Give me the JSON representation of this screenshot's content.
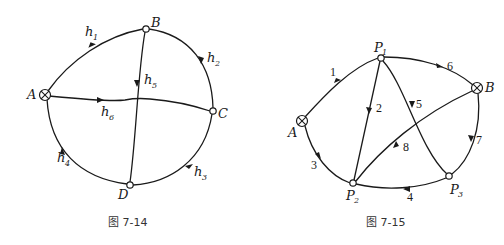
{
  "figures": [
    {
      "caption": "图 7-14",
      "nodes": [
        {
          "id": "A",
          "label": "A",
          "type": "source"
        },
        {
          "id": "B",
          "label": "B",
          "type": "junction"
        },
        {
          "id": "C",
          "label": "C",
          "type": "junction"
        },
        {
          "id": "D",
          "label": "D",
          "type": "junction"
        }
      ],
      "edges": [
        {
          "label": "h",
          "sub": "1",
          "from": "A",
          "to": "B"
        },
        {
          "label": "h",
          "sub": "2",
          "from": "B",
          "to": "C"
        },
        {
          "label": "h",
          "sub": "3",
          "from": "C",
          "to": "D"
        },
        {
          "label": "h",
          "sub": "4",
          "from": "D",
          "to": "A"
        },
        {
          "label": "h",
          "sub": "5",
          "from": "B",
          "to": "D"
        },
        {
          "label": "h",
          "sub": "6",
          "from": "A",
          "to": "C"
        }
      ]
    },
    {
      "caption": "图 7-15",
      "nodes": [
        {
          "id": "A",
          "label": "A",
          "type": "source"
        },
        {
          "id": "B",
          "label": "B",
          "type": "source"
        },
        {
          "id": "P1",
          "label": "P",
          "sub": "1",
          "type": "junction"
        },
        {
          "id": "P2",
          "label": "P",
          "sub": "2",
          "type": "junction"
        },
        {
          "id": "P3",
          "label": "P",
          "sub": "3",
          "type": "junction"
        }
      ],
      "edges": [
        {
          "label": "1",
          "from": "A",
          "to": "P1"
        },
        {
          "label": "2",
          "from": "P1",
          "to": "P2"
        },
        {
          "label": "3",
          "from": "A",
          "to": "P2"
        },
        {
          "label": "4",
          "from": "P3",
          "to": "P2"
        },
        {
          "label": "5",
          "from": "P1",
          "to": "P3"
        },
        {
          "label": "6",
          "from": "P1",
          "to": "B"
        },
        {
          "label": "7",
          "from": "B",
          "to": "P3"
        },
        {
          "label": "8",
          "from": "B",
          "to": "P2"
        }
      ]
    }
  ]
}
